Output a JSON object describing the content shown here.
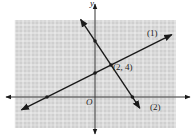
{
  "chart_data": {
    "type": "line",
    "title": "",
    "xlabel": "x",
    "ylabel": "y",
    "origin_label": "O",
    "grid": true,
    "xlim": [
      -10,
      10
    ],
    "ylim": [
      -4,
      10
    ],
    "series": [
      {
        "name": "(1)",
        "equation": "y = x/2 + 3",
        "slope": 0.5,
        "intercept": 3,
        "marked_points": [
          [
            -6,
            0
          ],
          [
            0,
            3
          ]
        ]
      },
      {
        "name": "(2)",
        "equation": "y = -3x/2 + 7",
        "slope": -1.5,
        "intercept": 7,
        "marked_points": [
          [
            0,
            7
          ],
          [
            4.67,
            0
          ]
        ]
      }
    ],
    "annotations": [
      {
        "text": "(2, 4)",
        "x": 2,
        "y": 4,
        "note": "intersection point"
      }
    ]
  },
  "labels": {
    "y_axis": "y",
    "x_axis": "x",
    "origin": "O",
    "line1": "(1)",
    "line2": "(2)",
    "intersection": "(2, 4)"
  },
  "colors": {
    "grid_bg": "#cfcfcf",
    "grid_line": "#f2f2f2",
    "axis": "#333333",
    "line": "#1a1a1a"
  }
}
